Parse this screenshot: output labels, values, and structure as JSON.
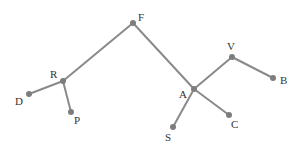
{
  "diagram": {
    "type": "tree",
    "nodes": [
      {
        "id": "F",
        "label": "F"
      },
      {
        "id": "R",
        "label": "R"
      },
      {
        "id": "D",
        "label": "D"
      },
      {
        "id": "P",
        "label": "P"
      },
      {
        "id": "A",
        "label": "A"
      },
      {
        "id": "V",
        "label": "V"
      },
      {
        "id": "B",
        "label": "B"
      },
      {
        "id": "C",
        "label": "C"
      },
      {
        "id": "S",
        "label": "S"
      }
    ],
    "edges": [
      [
        "F",
        "R"
      ],
      [
        "R",
        "D"
      ],
      [
        "R",
        "P"
      ],
      [
        "F",
        "A"
      ],
      [
        "A",
        "V"
      ],
      [
        "V",
        "B"
      ],
      [
        "A",
        "C"
      ],
      [
        "A",
        "S"
      ]
    ],
    "colors": {
      "edge": "#8a8a8a",
      "node": "#7d7d7d",
      "label": "#333333"
    }
  }
}
